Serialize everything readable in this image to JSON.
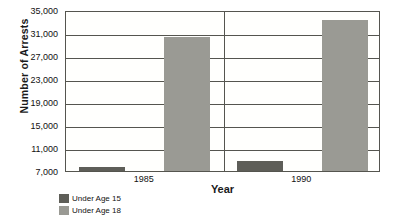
{
  "chart_data": {
    "type": "bar",
    "title": "",
    "xlabel": "Year",
    "ylabel": "Number of Arrests",
    "categories": [
      "1985",
      "1990"
    ],
    "series": [
      {
        "name": "Under Age 15",
        "values": [
          7700,
          8700
        ],
        "color": "#5e5e58"
      },
      {
        "name": "Under Age 18",
        "values": [
          30300,
          33300
        ],
        "color": "#9a9a94"
      }
    ],
    "ylim": [
      7000,
      35000
    ],
    "yticks": [
      7000,
      11000,
      15000,
      19000,
      23000,
      27000,
      31000,
      35000
    ],
    "ytick_labels": [
      "7,000",
      "11,000",
      "15,000",
      "19,000",
      "23,000",
      "27,000",
      "31,000",
      "35,000"
    ],
    "grid": true,
    "legend_position": "bottom-left"
  },
  "axes": {
    "y_title": "Number of Arrests",
    "x_title": "Year"
  },
  "legend": {
    "items": [
      {
        "label": "Under Age 15"
      },
      {
        "label": "Under Age 18"
      }
    ]
  }
}
